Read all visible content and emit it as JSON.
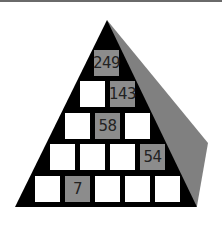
{
  "puzzle": {
    "type": "number-pyramid",
    "colors": {
      "front": "#000000",
      "side": "#808080",
      "given_cell": "#8c8c8c",
      "blank_cell": "#ffffff"
    },
    "rows": [
      [
        {
          "value": "249",
          "given": true
        }
      ],
      [
        {
          "value": "",
          "given": false
        },
        {
          "value": "143",
          "given": true
        }
      ],
      [
        {
          "value": "",
          "given": false
        },
        {
          "value": "58",
          "given": true
        },
        {
          "value": "",
          "given": false
        }
      ],
      [
        {
          "value": "",
          "given": false
        },
        {
          "value": "",
          "given": false
        },
        {
          "value": "",
          "given": false
        },
        {
          "value": "54",
          "given": true
        }
      ],
      [
        {
          "value": "",
          "given": false
        },
        {
          "value": "7",
          "given": true
        },
        {
          "value": "",
          "given": false
        },
        {
          "value": "",
          "given": false
        },
        {
          "value": "",
          "given": false
        }
      ]
    ]
  }
}
